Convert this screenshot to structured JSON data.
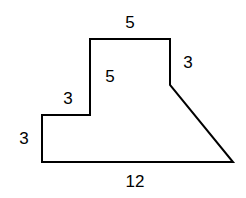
{
  "figure": {
    "kind": "polygon-with-dimension-labels",
    "background_color": "#ffffff",
    "stroke_color": "#000000",
    "stroke_width": 2,
    "fill_color": "none",
    "canvas": {
      "width": 246,
      "height": 198
    },
    "vertices": [
      {
        "name": "bottom-left",
        "x": 42,
        "y": 162
      },
      {
        "name": "lower-step-top-left",
        "x": 42,
        "y": 115
      },
      {
        "name": "lower-step-top-right",
        "x": 90,
        "y": 115
      },
      {
        "name": "upper-block-top-left",
        "x": 90,
        "y": 39
      },
      {
        "name": "upper-block-top-right",
        "x": 170,
        "y": 39
      },
      {
        "name": "diagonal-start",
        "x": 170,
        "y": 85
      },
      {
        "name": "bottom-right",
        "x": 233,
        "y": 162
      }
    ],
    "path": "M 42 162 L 42 115 L 90 115 L 90 39 L 170 39 L 170 85 L 233 162 Z"
  },
  "labels": [
    {
      "id": "top-edge",
      "text": "5",
      "x": 130,
      "y": 22,
      "edge": "top horizontal of upper block"
    },
    {
      "id": "inner-vertical",
      "text": "5",
      "x": 110,
      "y": 76,
      "edge": "vertical riser of upper block"
    },
    {
      "id": "right-vertical",
      "text": "3",
      "x": 188,
      "y": 62,
      "edge": "right vertical of upper block"
    },
    {
      "id": "step-horizontal",
      "text": "3",
      "x": 68,
      "y": 98,
      "edge": "horizontal tread of lower step"
    },
    {
      "id": "left-vertical",
      "text": "3",
      "x": 24,
      "y": 138,
      "edge": "left vertical side"
    },
    {
      "id": "bottom-edge",
      "text": "12",
      "x": 135,
      "y": 181,
      "edge": "bottom base"
    }
  ]
}
